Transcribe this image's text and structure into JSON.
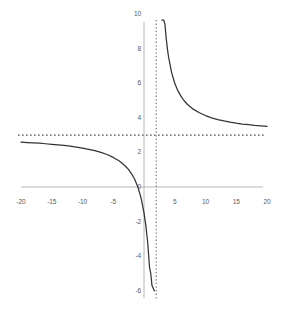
{
  "chart_data": {
    "type": "line",
    "title": "",
    "subtitle": "",
    "xlabel": "",
    "ylabel": "",
    "xlim": [
      -20,
      20
    ],
    "ylim": [
      -6,
      10
    ],
    "grid": false,
    "legend": null,
    "legend_position": "none",
    "x_ticks": [
      -20,
      -15,
      -10,
      -5,
      5,
      10,
      15,
      20
    ],
    "x_tick_labels": [
      "-20",
      "-15",
      "-10",
      "-5",
      "5",
      "10",
      "15",
      "20"
    ],
    "y_ticks": [
      10,
      8,
      6,
      4,
      2,
      0,
      -2,
      -4,
      -6
    ],
    "y_tick_labels": [
      "10",
      "8",
      "6",
      "4",
      "2",
      "0",
      "-2",
      "-4",
      "-6"
    ],
    "annotations": [
      {
        "name": "vertical-asymptote",
        "kind": "vertical-asymptote",
        "x": 2,
        "style": "dotted",
        "color": "#808080"
      },
      {
        "name": "horizontal-asymptote",
        "kind": "horizontal-asymptote",
        "y": 3,
        "style": "dotted",
        "color": "#595959"
      }
    ],
    "series": [
      {
        "name": "left-branch",
        "color": "#333333",
        "style": "solid",
        "x": [
          -20,
          -19,
          -18,
          -17,
          -16,
          -15,
          -14,
          -13,
          -12,
          -11,
          -10,
          -9,
          -8,
          -7,
          -6,
          -5,
          -4,
          -3,
          -2.5,
          -2,
          -1.5,
          -1,
          -0.5,
          0,
          0.3,
          0.6,
          0.9,
          1.1,
          1.3,
          1.45,
          1.55,
          1.62,
          1.66,
          1.69
        ],
        "y": [
          2.59,
          2.57,
          2.55,
          2.53,
          2.5,
          2.47,
          2.44,
          2.4,
          2.36,
          2.31,
          2.25,
          2.18,
          2.1,
          2.0,
          1.88,
          1.71,
          1.5,
          1.2,
          1.0,
          0.75,
          0.43,
          0.0,
          -0.6,
          -1.5,
          -2.22,
          -3.21,
          -4.64,
          -5.0,
          -5.71,
          -5.8,
          -5.9,
          -5.95,
          -6.0,
          -6.0
        ]
      },
      {
        "name": "right-branch",
        "color": "#333333",
        "style": "solid",
        "x": [
          2.9,
          3.0,
          3.1,
          3.2,
          3.4,
          3.6,
          3.8,
          4,
          4.5,
          5,
          5.5,
          6,
          6.5,
          7,
          8,
          9,
          10,
          11,
          12,
          13,
          14,
          15,
          16,
          17,
          18,
          19,
          20
        ],
        "y": [
          13.0,
          12.0,
          11.18,
          10.5,
          9.43,
          8.63,
          8.0,
          7.5,
          6.6,
          6.0,
          5.57,
          5.25,
          5.0,
          4.8,
          4.5,
          4.29,
          4.13,
          4.0,
          3.9,
          3.82,
          3.75,
          3.69,
          3.64,
          3.6,
          3.56,
          3.53,
          3.5
        ]
      }
    ],
    "function_expression": "y = 3 + 9/(x - 2)",
    "axes": {
      "x_axis_color": "#b3b3b3",
      "y_axis_color": "#b3b3b3",
      "origin_label": "0"
    }
  },
  "geometry": {
    "x0_px": 144,
    "y0_px": 187,
    "px_per_x_unit": 6.15,
    "px_per_y_unit": 17.3,
    "x_axis_left_px": 21,
    "x_axis_right_px": 263,
    "y_axis_top_px": 22,
    "y_axis_bottom_px": 298
  }
}
